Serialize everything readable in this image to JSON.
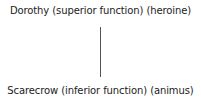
{
  "diagram": {
    "nodes": [
      {
        "id": "top",
        "label": "Dorothy (superior function) (heroine)"
      },
      {
        "id": "bottom",
        "label": "Scarecrow (inferior function) (animus)"
      }
    ],
    "edges": [
      {
        "from": "top",
        "to": "bottom"
      }
    ],
    "colors": {
      "line": "#555555",
      "text": "#222222",
      "background": "#ffffff"
    }
  }
}
